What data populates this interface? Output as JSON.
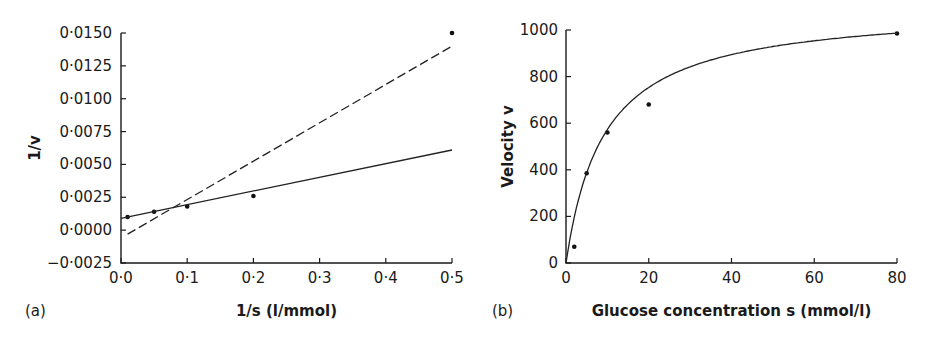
{
  "chart_data": [
    {
      "panel": "(a)",
      "type": "scatter",
      "title": "",
      "xlabel": "1/s (l/mmol)",
      "ylabel": "1/v",
      "xlim": [
        0.0,
        0.5
      ],
      "ylim": [
        -0.0025,
        0.015
      ],
      "grid": false,
      "legend": null,
      "x_ticks": [
        "0·0",
        "0·1",
        "0·2",
        "0·3",
        "0·4",
        "0·5"
      ],
      "x_tick_values": [
        0.0,
        0.1,
        0.2,
        0.3,
        0.4,
        0.5
      ],
      "y_ticks": [
        "0·0150",
        "0·0125",
        "0·0100",
        "0·0075",
        "0·0050",
        "0·0025",
        "0·0000",
        "−0·0025"
      ],
      "y_tick_values": [
        0.015,
        0.0125,
        0.01,
        0.0075,
        0.005,
        0.0025,
        0.0,
        -0.0025
      ],
      "series": [
        {
          "name": "data points",
          "style": "markers",
          "x": [
            0.01,
            0.05,
            0.1,
            0.2,
            0.5
          ],
          "y": [
            0.001,
            0.0014,
            0.0018,
            0.0026,
            0.015
          ]
        },
        {
          "name": "solid fit line",
          "style": "solid",
          "x": [
            0.0,
            0.5
          ],
          "y": [
            0.0009,
            0.0061
          ]
        },
        {
          "name": "dashed fit line",
          "style": "dashed",
          "x": [
            0.01,
            0.5
          ],
          "y": [
            -0.0003,
            0.014
          ]
        }
      ]
    },
    {
      "panel": "(b)",
      "type": "scatter",
      "title": "",
      "xlabel": "Glucose concentration s (mmol/l)",
      "ylabel": "Velocity v",
      "xlim": [
        0,
        80
      ],
      "ylim": [
        0,
        1000
      ],
      "grid": false,
      "legend": null,
      "x_ticks": [
        "0",
        "20",
        "40",
        "60",
        "80"
      ],
      "x_tick_values": [
        0,
        20,
        40,
        60,
        80
      ],
      "y_ticks": [
        "1000",
        "800",
        "600",
        "400",
        "200",
        "0"
      ],
      "y_tick_values": [
        1000,
        800,
        600,
        400,
        200,
        0
      ],
      "series": [
        {
          "name": "data points",
          "style": "markers",
          "x": [
            2,
            5,
            10,
            20,
            80
          ],
          "y": [
            70,
            385,
            560,
            680,
            985
          ]
        },
        {
          "name": "fitted curve",
          "style": "solid",
          "model": "Michaelis-Menten",
          "x": [
            0,
            2,
            5,
            10,
            20,
            40,
            60,
            80
          ],
          "y": [
            0,
            200,
            390,
            530,
            710,
            870,
            940,
            985
          ]
        }
      ]
    }
  ]
}
